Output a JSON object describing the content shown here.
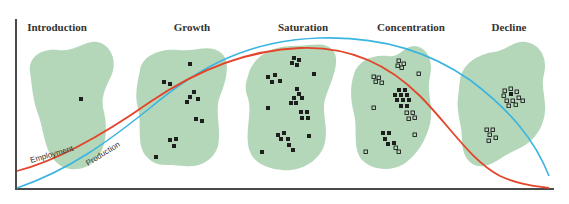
{
  "diagram": {
    "stages": [
      {
        "label": "Introduction",
        "x": 57
      },
      {
        "label": "Growth",
        "x": 192
      },
      {
        "label": "Saturation",
        "x": 303
      },
      {
        "label": "Concentration",
        "x": 411
      },
      {
        "label": "Decline",
        "x": 509
      }
    ],
    "curves": {
      "employment": {
        "label": "Employment",
        "color": "#e2452a"
      },
      "production": {
        "label": "Production",
        "color": "#3ab4e0"
      }
    },
    "colors": {
      "region_fill": "#a7d0ad",
      "axis": "#4a4a4a",
      "establishment_marker": "#1e1e1e"
    },
    "legend_markers": {
      "filled": "firm establishment",
      "hollow": "closed / relocated establishment"
    }
  }
}
